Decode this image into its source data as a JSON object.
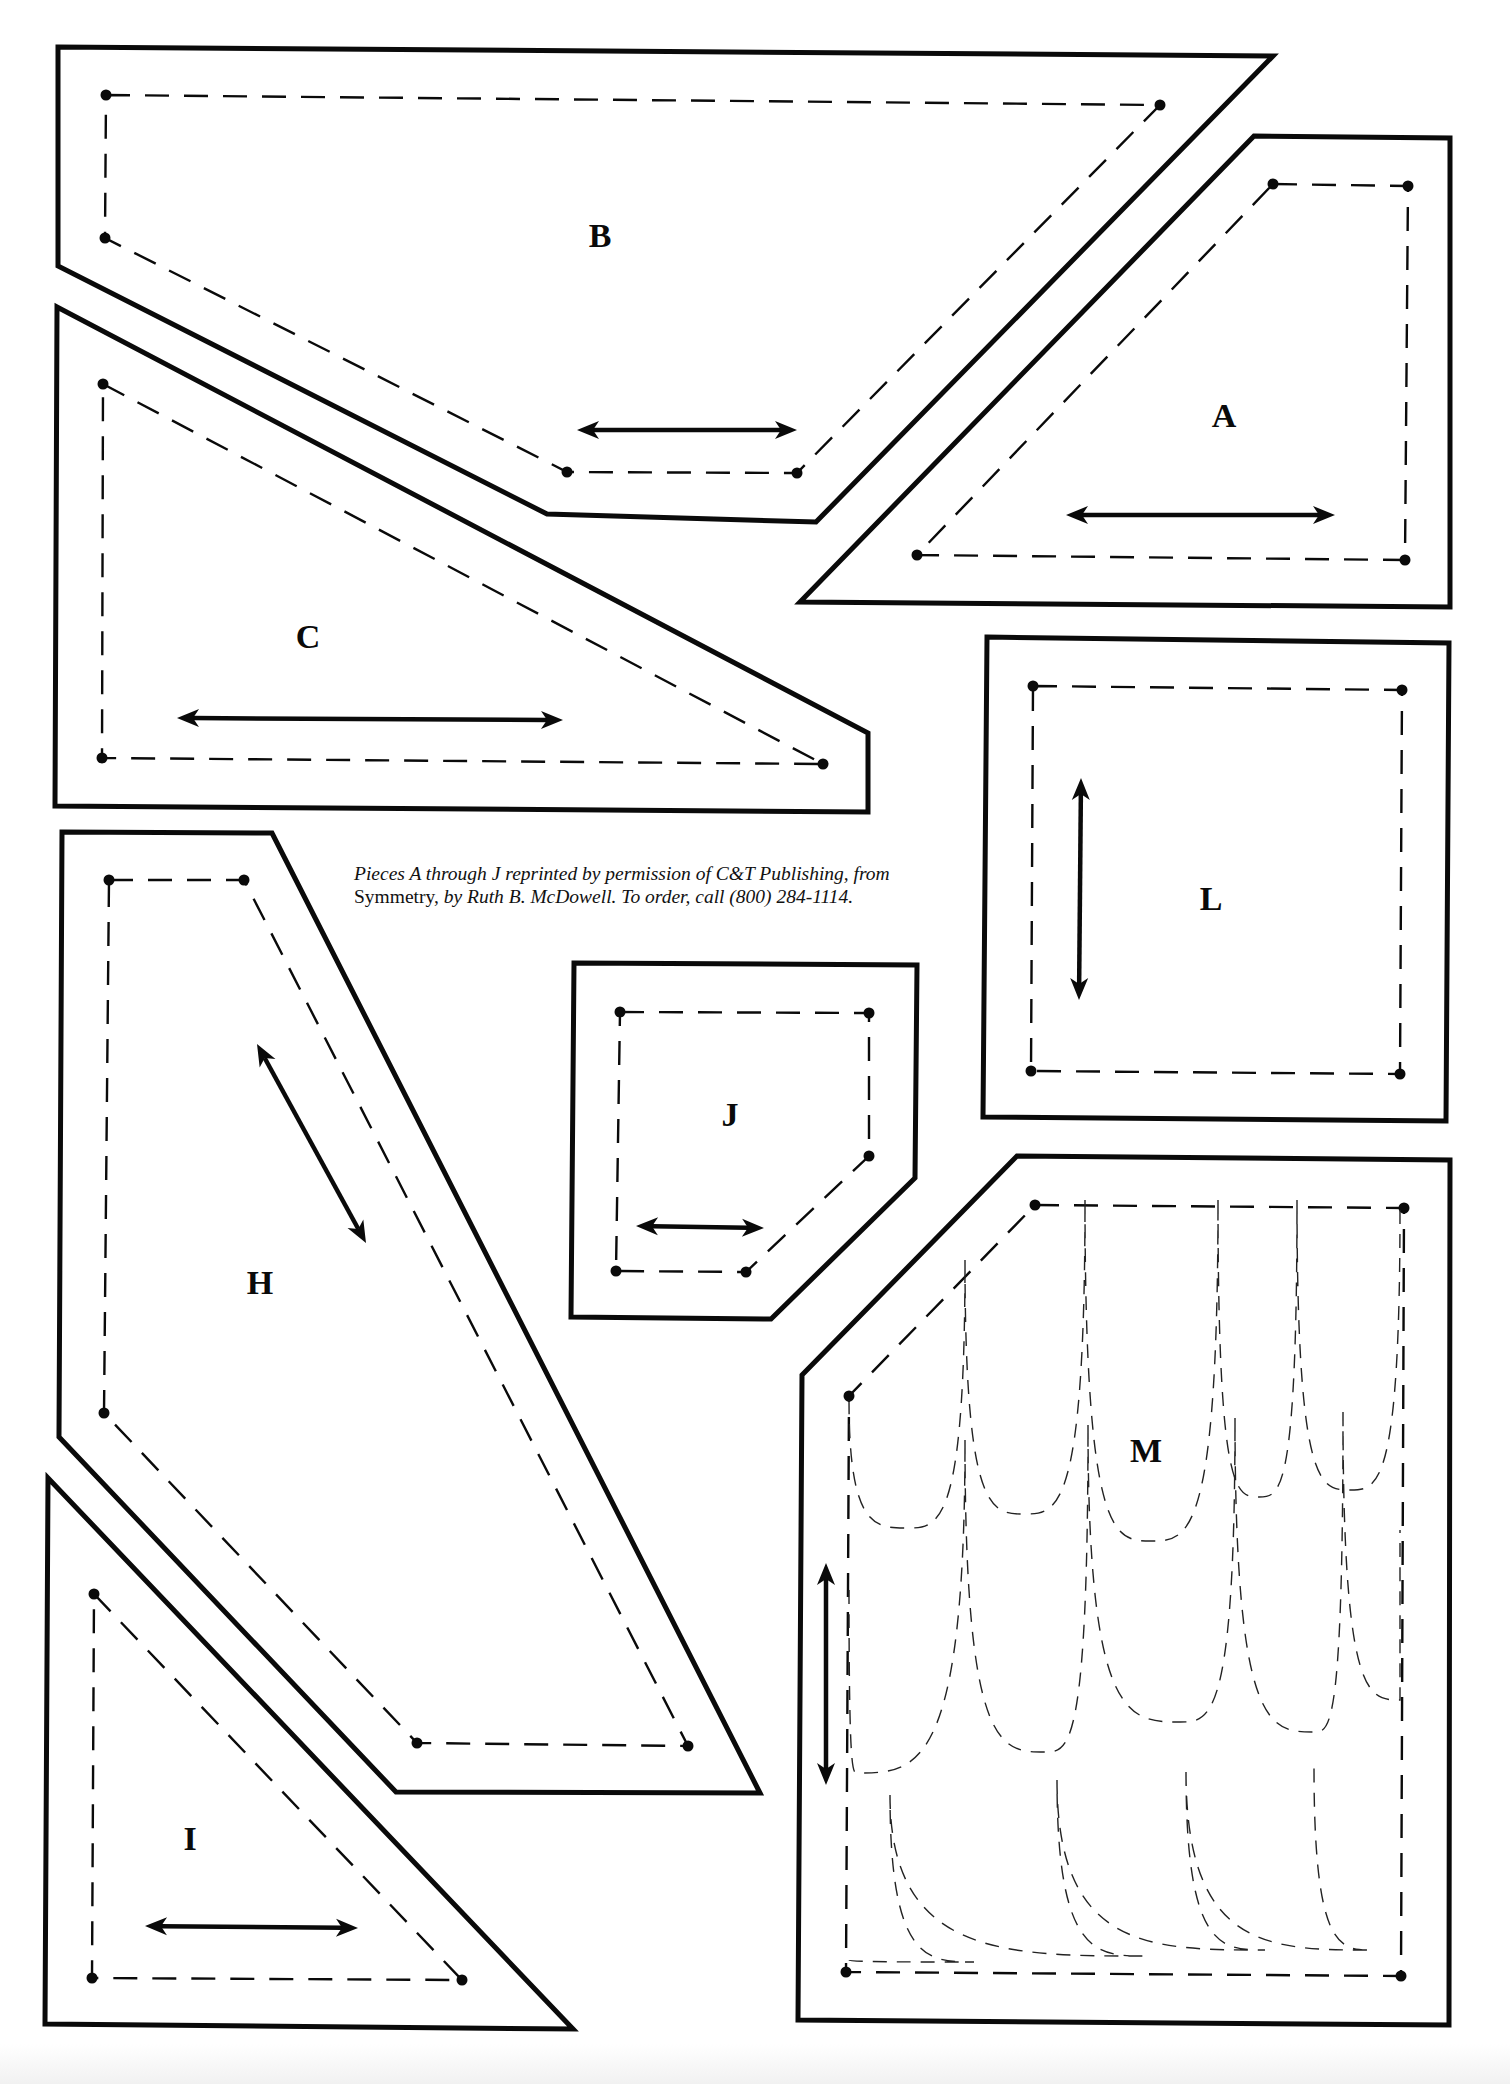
{
  "page": {
    "background": "#ffffff",
    "ink_color": "#0a0a0a"
  },
  "credit": {
    "line1_italic": "Pieces A through J reprinted by permission of C&T Publishing, from",
    "line2_roman": "Symmetry,",
    "line2_italic": " by Ruth B. McDowell. To order, call (800) 284-1114."
  },
  "pieces": [
    {
      "id": "B",
      "label": "B",
      "label_pos": [
        600,
        235
      ],
      "outline": [
        [
          58,
          47
        ],
        [
          1273,
          56
        ],
        [
          816,
          522
        ],
        [
          547,
          514
        ],
        [
          58,
          266
        ]
      ],
      "seam": [
        [
          106,
          95
        ],
        [
          1160,
          105
        ],
        [
          797,
          473
        ],
        [
          567,
          472
        ],
        [
          105,
          238
        ]
      ],
      "grain": {
        "from": [
          577,
          430
        ],
        "to": [
          797,
          430
        ]
      }
    },
    {
      "id": "A",
      "label": "A",
      "label_pos": [
        1224,
        415
      ],
      "outline": [
        [
          1254,
          136
        ],
        [
          1450,
          138
        ],
        [
          1450,
          607
        ],
        [
          800,
          602
        ]
      ],
      "seam": [
        [
          1273,
          184
        ],
        [
          1408,
          186
        ],
        [
          1405,
          560
        ],
        [
          917,
          555
        ]
      ],
      "grain": {
        "from": [
          1066,
          515
        ],
        "to": [
          1335,
          515
        ]
      }
    },
    {
      "id": "C",
      "label": "C",
      "label_pos": [
        308,
        636
      ],
      "outline": [
        [
          57,
          307
        ],
        [
          868,
          733
        ],
        [
          868,
          812
        ],
        [
          55,
          806
        ]
      ],
      "seam": [
        [
          103,
          384
        ],
        [
          823,
          764
        ],
        [
          102,
          758
        ]
      ],
      "grain": {
        "from": [
          177,
          718
        ],
        "to": [
          563,
          720
        ]
      }
    },
    {
      "id": "L",
      "label": "L",
      "label_pos": [
        1211,
        898
      ],
      "outline": [
        [
          987,
          637
        ],
        [
          1449,
          643
        ],
        [
          1446,
          1121
        ],
        [
          983,
          1117
        ]
      ],
      "seam": [
        [
          1033,
          686
        ],
        [
          1402,
          690
        ],
        [
          1400,
          1074
        ],
        [
          1031,
          1071
        ]
      ],
      "grain": {
        "from": [
          1081,
          778
        ],
        "to": [
          1079,
          1000
        ]
      }
    },
    {
      "id": "J",
      "label": "J",
      "label_pos": [
        730,
        1114
      ],
      "outline": [
        [
          574,
          963
        ],
        [
          917,
          965
        ],
        [
          915,
          1178
        ],
        [
          771,
          1319
        ],
        [
          571,
          1317
        ]
      ],
      "seam": [
        [
          620,
          1012
        ],
        [
          869,
          1013
        ],
        [
          869,
          1156
        ],
        [
          746,
          1272
        ],
        [
          616,
          1271
        ]
      ],
      "grain": {
        "from": [
          636,
          1226
        ],
        "to": [
          764,
          1228
        ]
      }
    },
    {
      "id": "H",
      "label": "H",
      "label_pos": [
        260,
        1282
      ],
      "outline": [
        [
          62,
          832
        ],
        [
          272,
          833
        ],
        [
          760,
          1793
        ],
        [
          396,
          1792
        ],
        [
          59,
          1437
        ]
      ],
      "seam": [
        [
          109,
          880
        ],
        [
          244,
          880
        ],
        [
          688,
          1746
        ],
        [
          417,
          1743
        ],
        [
          104,
          1413
        ]
      ],
      "grain": {
        "from": [
          257,
          1044
        ],
        "to": [
          366,
          1243
        ]
      }
    },
    {
      "id": "I",
      "label": "I",
      "label_pos": [
        190,
        1838
      ],
      "outline": [
        [
          48,
          1478
        ],
        [
          573,
          2029
        ],
        [
          45,
          2024
        ]
      ],
      "seam": [
        [
          94,
          1594
        ],
        [
          462,
          1980
        ],
        [
          92,
          1978
        ]
      ],
      "grain": {
        "from": [
          145,
          1926
        ],
        "to": [
          358,
          1928
        ]
      }
    },
    {
      "id": "M",
      "label": "M",
      "label_pos": [
        1146,
        1450
      ],
      "outline": [
        [
          1017,
          1156
        ],
        [
          1450,
          1160
        ],
        [
          1449,
          2025
        ],
        [
          798,
          2020
        ],
        [
          802,
          1375
        ]
      ],
      "seam": [
        [
          1035,
          1205
        ],
        [
          1404,
          1208
        ],
        [
          1401,
          1976
        ],
        [
          846,
          1972
        ],
        [
          849,
          1396
        ]
      ],
      "grain": {
        "from": [
          826,
          1563
        ],
        "to": [
          826,
          1785
        ]
      },
      "quilting_rows": [
        {
          "peaks": [
            [
              849,
              1400
            ],
            [
              965,
              1260
            ],
            [
              1085,
              1200
            ],
            [
              1218,
              1200
            ],
            [
              1297,
              1200
            ],
            [
              1400,
              1210
            ]
          ],
          "troughs": [
            [
              907,
              1528
            ],
            [
              1024,
              1514
            ],
            [
              1151,
              1541
            ],
            [
              1259,
              1497
            ],
            [
              1350,
              1490
            ]
          ]
        },
        {
          "peaks": [
            [
              849,
              1590
            ],
            [
              965,
              1440
            ],
            [
              1088,
              1425
            ],
            [
              1235,
              1418
            ],
            [
              1343,
              1412
            ],
            [
              1400,
              1530
            ]
          ],
          "troughs": [
            [
              857,
              1773
            ],
            [
              1045,
              1752
            ],
            [
              1180,
              1722
            ],
            [
              1314,
              1732
            ],
            [
              1400,
              1700
            ]
          ]
        },
        {
          "peaks": [
            [
              849,
              1960
            ],
            [
              890,
              1795
            ],
            [
              1057,
              1780
            ],
            [
              1186,
              1772
            ],
            [
              1314,
              1768
            ],
            [
              1400,
              1962
            ]
          ],
          "troughs": [
            [
              974,
              1962
            ],
            [
              1145,
              1956
            ],
            [
              1265,
              1950
            ],
            [
              1372,
              1950
            ]
          ]
        }
      ]
    }
  ]
}
